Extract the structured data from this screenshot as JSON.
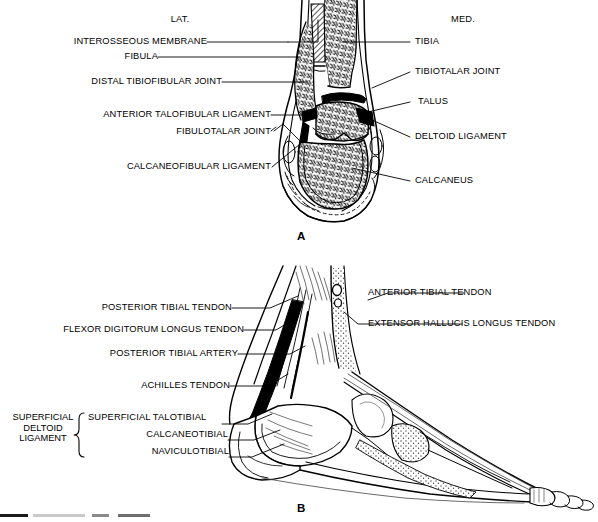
{
  "figure": {
    "type": "anatomical-illustration",
    "line_color": "#000000",
    "background_color": "#ffffff",
    "stipple_color": "#555555"
  },
  "panel_a": {
    "letter": "A",
    "view": "coronal-section",
    "orientation": {
      "left": "LAT.",
      "right": "MED."
    },
    "labels_left": [
      {
        "id": "interosseous-membrane",
        "text": "INTEROSSEOUS MEMBRANE"
      },
      {
        "id": "fibula",
        "text": "FIBULA"
      },
      {
        "id": "distal-tibiofibular-joint",
        "text": "DISTAL TIBIOFIBULAR JOINT"
      },
      {
        "id": "anterior-talofibular-ligament",
        "text": "ANTERIOR TALOFIBULAR LIGAMENT"
      },
      {
        "id": "fibulotalar-joint",
        "text": "FIBULOTALAR JOINT"
      },
      {
        "id": "calcaneofibular-ligament",
        "text": "CALCANEOFIBULAR LIGAMENT"
      }
    ],
    "labels_right": [
      {
        "id": "tibia",
        "text": "TIBIA"
      },
      {
        "id": "tibiotalar-joint",
        "text": "TIBIOTALAR JOINT"
      },
      {
        "id": "talus",
        "text": "TALUS"
      },
      {
        "id": "deltoid-ligament",
        "text": "DELTOID LIGAMENT"
      },
      {
        "id": "calcaneus",
        "text": "CALCANEUS"
      }
    ]
  },
  "panel_b": {
    "letter": "B",
    "view": "medial-sagittal",
    "labels_left": [
      {
        "id": "posterior-tibial-tendon",
        "text": "POSTERIOR TIBIAL TENDON"
      },
      {
        "id": "flexor-digitorum-longus-tendon",
        "text": "FLEXOR DIGITORUM LONGUS TENDON"
      },
      {
        "id": "posterior-tibial-artery",
        "text": "POSTERIOR TIBIAL ARTERY"
      },
      {
        "id": "achilles-tendon",
        "text": "ACHILLES TENDON"
      }
    ],
    "labels_right": [
      {
        "id": "anterior-tibial-tendon",
        "text": "ANTERIOR TIBIAL TENDON"
      },
      {
        "id": "extensor-hallucis-longus-tendon",
        "text": "EXTENSOR HALLUCIS LONGUS TENDON"
      }
    ],
    "bracket_group": {
      "id": "superficial-deltoid-ligament",
      "lines": [
        "SUPERFICIAL",
        "DELTOID",
        "LIGAMENT"
      ],
      "members": [
        {
          "id": "superficial-talotibial",
          "text": "SUPERFICIAL TALOTIBIAL"
        },
        {
          "id": "calcaneotibial",
          "text": "CALCANEOTIBIAL"
        },
        {
          "id": "naviculotibial",
          "text": "NAVICULOTIBIAL"
        }
      ]
    }
  }
}
